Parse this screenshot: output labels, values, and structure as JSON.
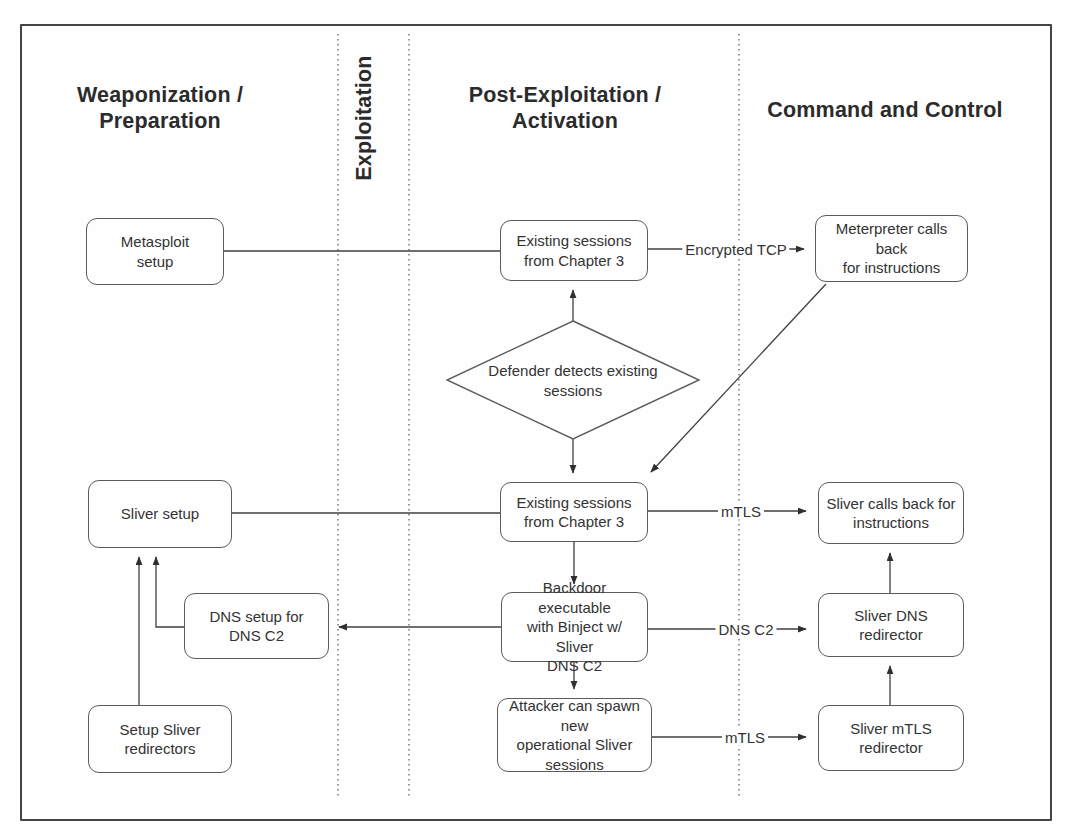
{
  "figure": {
    "type": "flowchart"
  },
  "phases": {
    "weaponization": "Weaponization /\nPreparation",
    "exploitation": "Exploitation",
    "post_exploitation": "Post-Exploitation /\nActivation",
    "command_and_control": "Command and Control"
  },
  "nodes": {
    "metasploit_setup": "Metasploit\nsetup",
    "existing_sessions_1": "Existing sessions\nfrom Chapter 3",
    "meterpreter_callback": "Meterpreter calls back\nfor instructions",
    "defender_detects": "Defender detects existing\nsessions",
    "sliver_setup": "Sliver setup",
    "existing_sessions_2": "Existing sessions\nfrom Chapter 3",
    "sliver_callback": "Sliver calls back for\ninstructions",
    "dns_setup": "DNS setup for\nDNS C2",
    "backdoor_executable": "Backdoor executable\nwith Binject w/ Sliver\nDNS C2",
    "sliver_dns_redirector": "Sliver DNS redirector",
    "setup_sliver_redirectors": "Setup Sliver\nredirectors",
    "attacker_spawn": "Attacker can spawn new\noperational Sliver\nsessions",
    "sliver_mtls_redirector": "Sliver mTLS\nredirector"
  },
  "edge_labels": {
    "encrypted_tcp": "Encrypted TCP",
    "mtls_top": "mTLS",
    "dns_c2": "DNS C2",
    "mtls_bottom": "mTLS"
  },
  "colors": {
    "ink": "#2f2f2f",
    "line": "#3f3f3f",
    "box_border": "#5b5b5d",
    "background": "#fefefe"
  }
}
